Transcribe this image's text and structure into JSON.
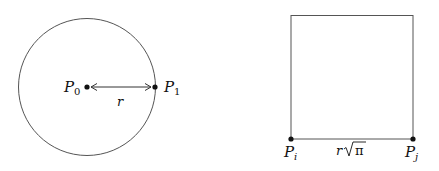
{
  "diagram": {
    "left": {
      "shape": "circle",
      "center_point": {
        "label": "P",
        "subscript": "0"
      },
      "edge_point": {
        "label": "P",
        "subscript": "1"
      },
      "radius_label": "r"
    },
    "right": {
      "shape": "square",
      "left_point": {
        "label": "P",
        "subscript": "i"
      },
      "right_point": {
        "label": "P",
        "subscript": "j"
      },
      "side_label_var": "r",
      "side_label_sqrt": "π"
    },
    "colors": {
      "stroke": "#555555",
      "point": "#111111",
      "text": "#111111"
    }
  }
}
